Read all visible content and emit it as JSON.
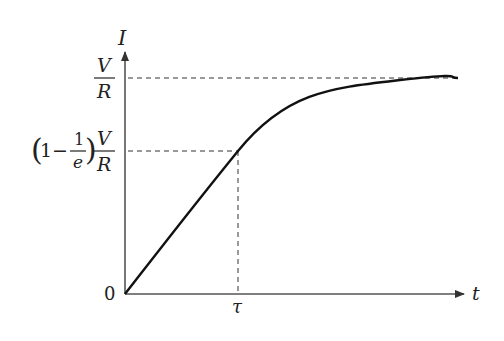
{
  "diagram": {
    "axes": {
      "y_label": "I",
      "x_label": "t",
      "origin_label": "0"
    },
    "y_ticks": {
      "max": {
        "numerator": "V",
        "denominator": "R"
      },
      "tau_level": {
        "prefix": "1−",
        "inner_num": "1",
        "inner_den": "e",
        "numerator": "V",
        "denominator": "R"
      }
    },
    "x_ticks": {
      "tau": "τ"
    },
    "curve": "I = (V/R)(1 − e^(−t/τ))",
    "colors": {
      "axis": "#555555",
      "curve": "#111111",
      "dashed": "#333333",
      "text": "#222222"
    }
  }
}
